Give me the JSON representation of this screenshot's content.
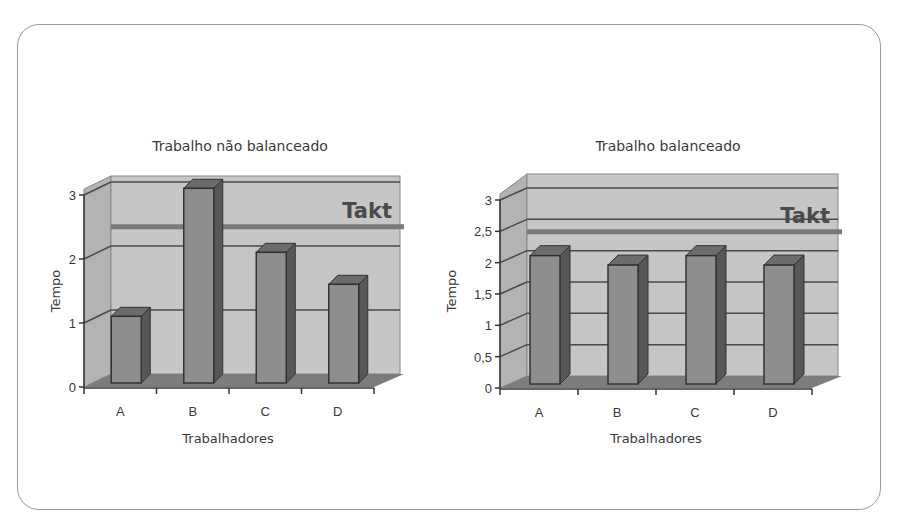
{
  "chart_data": [
    {
      "type": "bar",
      "style": "3d-column",
      "title": "Trabalho não balanceado",
      "xlabel": "Trabalhadores",
      "ylabel": "Tempo",
      "categories": [
        "A",
        "B",
        "C",
        "D"
      ],
      "values": [
        1,
        3,
        2,
        1.5
      ],
      "yticks": [
        "0",
        "1",
        "2",
        "3"
      ],
      "ytick_values": [
        0,
        1,
        2,
        3
      ],
      "ylim": [
        0,
        3
      ],
      "grid": true,
      "reference_line": {
        "label": "Takt",
        "value": 2.3
      },
      "legend": null
    },
    {
      "type": "bar",
      "style": "3d-column",
      "title": "Trabalho balanceado",
      "xlabel": "Trabalhadores",
      "ylabel": "Tempo",
      "categories": [
        "A",
        "B",
        "C",
        "D"
      ],
      "values": [
        2.0,
        1.85,
        2.0,
        1.85
      ],
      "yticks": [
        "0",
        "0,5",
        "1",
        "1,5",
        "2",
        "2,5",
        "3"
      ],
      "ytick_values": [
        0,
        0.5,
        1,
        1.5,
        2,
        2.5,
        3
      ],
      "ylim": [
        0,
        3
      ],
      "grid": true,
      "reference_line": {
        "label": "Takt",
        "value": 2.3
      },
      "legend": null
    }
  ],
  "colors": {
    "wall": "#c6c6c6",
    "side_wall": "#b3b3b3",
    "floor": "#7c7c7c",
    "bar_front": "#8e8e8e",
    "bar_top": "#6c6c6c",
    "bar_side": "#575757",
    "outline": "#333333",
    "grid": "#4a4a4a",
    "takt_line": "#7a7a7a"
  }
}
